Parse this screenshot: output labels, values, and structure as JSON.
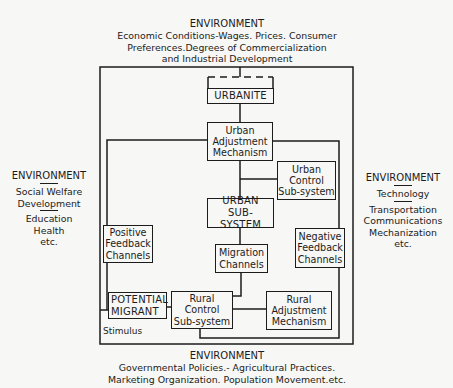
{
  "diagram": {
    "top_env": {
      "title": "ENVIRONMENT",
      "lines": [
        "Economic Conditions-Wages. Prices. Consumer",
        "Preferences.Degrees of Commercialization",
        "and Industrial Development"
      ]
    },
    "left_env": {
      "title": "ENVIRONMENT",
      "group1": [
        "Social Welfare",
        "Development"
      ],
      "group2": [
        "Education",
        "Health",
        "etc."
      ]
    },
    "right_env": {
      "title": "ENVIRONMENT",
      "group1": [
        "Technology"
      ],
      "group2": [
        "Transportation",
        "Communications",
        "Mechanization",
        "etc."
      ]
    },
    "bottom_env": {
      "title": "ENVIRONMENT",
      "lines": [
        "Governmental Policies.- Agricultural Practices.",
        "Marketing Organization. Population Movement.etc."
      ]
    },
    "nodes": {
      "urbanite": [
        "URBANITE"
      ],
      "urban_adjustment": [
        "Urban",
        "Adjustment",
        "Mechanism"
      ],
      "urban_control": [
        "Urban",
        "Control",
        "Sub-system"
      ],
      "urban_subsystem": [
        "URBAN",
        "SUB-SYSTEM"
      ],
      "positive_feedback": [
        "Positive",
        "Feedback",
        "Channels"
      ],
      "migration": [
        "Migration",
        "Channels"
      ],
      "negative_feedback": [
        "Negative",
        "Feedback",
        "Channels"
      ],
      "potential_migrant": [
        "POTENTIAL",
        "MIGRANT"
      ],
      "rural_control": [
        "Rural",
        "Control",
        "Sub-system"
      ],
      "rural_adjustment": [
        "Rural",
        "Adjustment",
        "Mechanism"
      ]
    },
    "stimulus_label": "Stimulus"
  }
}
